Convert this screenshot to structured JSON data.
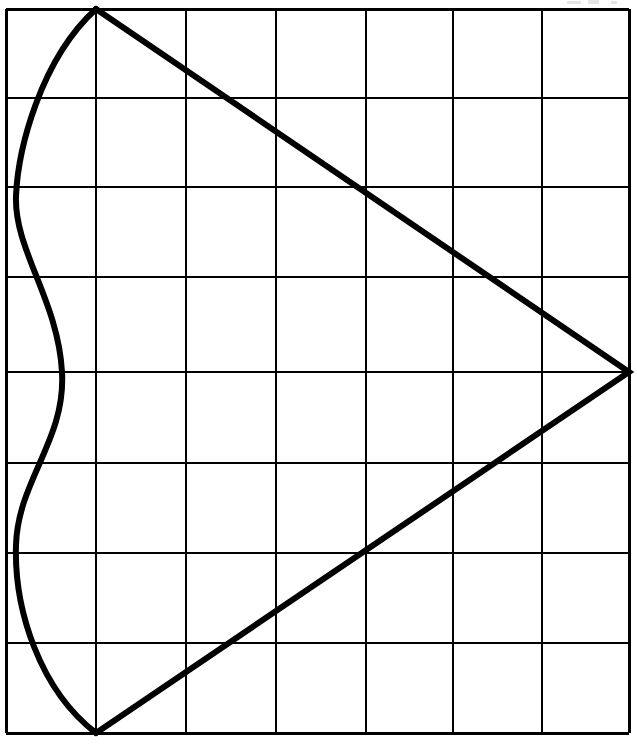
{
  "figure": {
    "background_color": "#ffffff",
    "ink_color": "#000000",
    "canvas": {
      "width": 637,
      "height": 748
    }
  },
  "chart_data": {
    "type": "line",
    "subtitle": "",
    "xlabel": "",
    "ylabel": "",
    "grid": true,
    "legend_position": "none",
    "xlim": [
      0,
      7
    ],
    "ylim": [
      0,
      8
    ],
    "x_tick_labels": [],
    "y_tick_labels": [],
    "grid_columns": 7,
    "grid_rows": 8,
    "grid_vertical_lines_px": [
      6,
      96,
      186,
      276,
      366,
      453,
      542,
      629
    ],
    "grid_horizontal_lines_px": [
      9,
      98,
      187,
      277,
      372,
      463,
      553,
      643,
      733
    ],
    "grid_border_width_px": 3,
    "grid_inner_width_px": 2.6,
    "shape_stroke_width_px": 6,
    "series": [
      {
        "name": "triangle",
        "type": "polyline",
        "closed": false,
        "points_px": [
          [
            96,
            9
          ],
          [
            629,
            372
          ],
          [
            96,
            733
          ]
        ],
        "description": "Triangle formed by two straight edges meeting at a right-hand vertex on the middle horizontal grid line"
      },
      {
        "name": "sinuous-curve",
        "type": "bezier-curve",
        "closed": false,
        "start_px": [
          96,
          9
        ],
        "end_px": [
          96,
          733
        ],
        "control_points_px": [
          [
            40,
            60
          ],
          [
            18,
            150
          ],
          [
            16,
            196
          ],
          [
            14,
            250
          ],
          [
            58,
            300
          ],
          [
            62,
            372
          ],
          [
            66,
            440
          ],
          [
            18,
            480
          ],
          [
            16,
            545
          ],
          [
            14,
            610
          ],
          [
            40,
            690
          ],
          [
            96,
            733
          ]
        ],
        "description": "S-shaped left bulge from top vertex down to bottom vertex, pinching inward near the middle row"
      }
    ],
    "annotations": []
  },
  "scan_artifacts": [
    {
      "name": "top-edge-speck-1",
      "x": 567,
      "y": 1,
      "width": 14,
      "height": 3
    },
    {
      "name": "top-edge-speck-2",
      "x": 588,
      "y": 0,
      "width": 11,
      "height": 4
    },
    {
      "name": "top-edge-speck-3",
      "x": 611,
      "y": 1,
      "width": 6,
      "height": 3
    }
  ]
}
